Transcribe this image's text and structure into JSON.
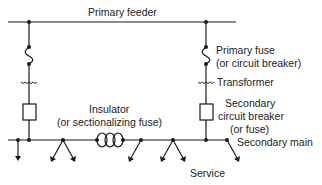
{
  "labels": {
    "primary_feeder": "Primary feeder",
    "primary_fuse_line1": "Primary fuse",
    "primary_fuse_line2": "(or circuit breaker)",
    "transformer": "Transformer",
    "secondary_cb_line1": "Secondary",
    "secondary_cb_line2": "circuit breaker",
    "secondary_cb_line3": "(or fuse)",
    "secondary_main": "Secondary main",
    "insulator_line1": "Insulator",
    "insulator_line2": "(or sectionalizing fuse)",
    "service": "Service"
  },
  "colors": {
    "line": "#1a1a1a",
    "text": "#222222"
  }
}
